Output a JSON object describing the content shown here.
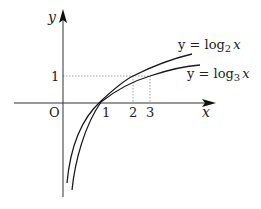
{
  "figure": {
    "axes": {
      "x_label": "x",
      "y_label": "y",
      "origin_label": "O"
    },
    "ticks": {
      "x": [
        "1",
        "2",
        "3"
      ],
      "y": [
        "1"
      ]
    },
    "curves": [
      {
        "name": "log2",
        "label_prefix": "y = log",
        "base": "2",
        "var": "x"
      },
      {
        "name": "log3",
        "label_prefix": "y = log",
        "base": "3",
        "var": "x"
      }
    ],
    "colors": {
      "curve": "#1a1a1a",
      "axis": "#333333",
      "guide": "#888888"
    }
  }
}
